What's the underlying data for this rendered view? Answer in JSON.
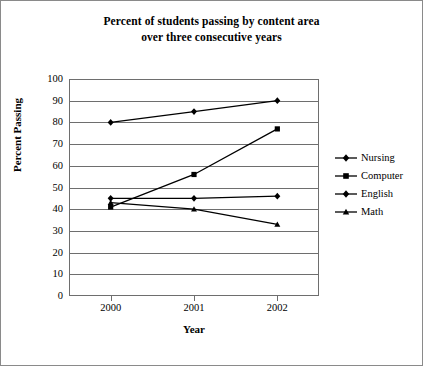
{
  "chart_data": {
    "type": "line",
    "title": "Percent of students passing by content area over three consecutive years",
    "title_lines": [
      "Percent of students passing by content area",
      "over three consecutive years"
    ],
    "xlabel": "Year",
    "ylabel": "Percent Passing",
    "categories": [
      "2000",
      "2001",
      "2002"
    ],
    "x": [
      2000,
      2001,
      2002
    ],
    "ylim": [
      0,
      100
    ],
    "ytick_step": 10,
    "yticks": [
      100,
      90,
      80,
      70,
      60,
      50,
      40,
      30,
      20,
      10,
      0
    ],
    "grid": "horizontal",
    "legend_position": "right",
    "series": [
      {
        "name": "Nursing",
        "marker": "diamond",
        "values": [
          80,
          85,
          90
        ]
      },
      {
        "name": "Computer",
        "marker": "square",
        "values": [
          41,
          56,
          77
        ]
      },
      {
        "name": "English",
        "marker": "diamond",
        "values": [
          45,
          45,
          46
        ]
      },
      {
        "name": "Math",
        "marker": "triangle",
        "values": [
          43,
          40,
          33
        ]
      }
    ],
    "line_color": "#000000",
    "grid_color": "#6e6e6e",
    "background": "#ffffff"
  },
  "legend": {
    "items": [
      {
        "label": "Nursing"
      },
      {
        "label": "Computer"
      },
      {
        "label": "English"
      },
      {
        "label": "Math"
      }
    ]
  }
}
